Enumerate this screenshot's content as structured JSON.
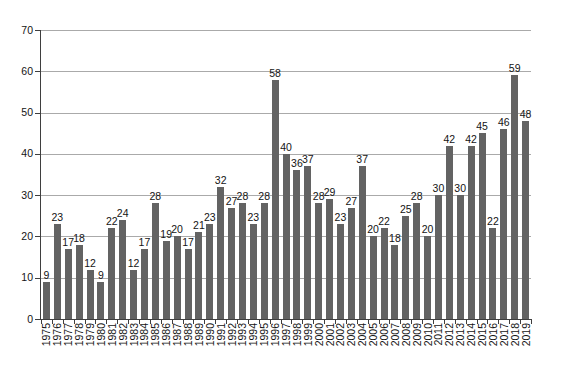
{
  "chart_data": {
    "type": "bar",
    "title": "",
    "xlabel": "",
    "ylabel": "",
    "categories": [
      "1975",
      "1976",
      "1977",
      "1978",
      "1979",
      "1980",
      "1981",
      "1982",
      "1983",
      "1984",
      "1985",
      "1986",
      "1987",
      "1988",
      "1989",
      "1990",
      "1991",
      "1992",
      "1993",
      "1994",
      "1995",
      "1996",
      "1997",
      "1998",
      "1999",
      "2000",
      "2001",
      "2002",
      "2003",
      "2004",
      "2005",
      "2006",
      "2007",
      "2008",
      "2009",
      "2010",
      "2011",
      "2012",
      "2013",
      "2014",
      "2015",
      "2016",
      "2017",
      "2018",
      "2019"
    ],
    "values": [
      9,
      23,
      17,
      18,
      12,
      9,
      22,
      24,
      12,
      17,
      28,
      19,
      20,
      17,
      21,
      23,
      32,
      27,
      28,
      23,
      28,
      58,
      40,
      36,
      37,
      28,
      29,
      23,
      27,
      37,
      20,
      22,
      18,
      25,
      28,
      20,
      30,
      42,
      30,
      42,
      45,
      22,
      46,
      59,
      48
    ],
    "ylim": [
      0,
      70
    ],
    "yticks": [
      0,
      10,
      20,
      30,
      40,
      50,
      60,
      70
    ],
    "grid": true,
    "bar_labels": true,
    "legend": "none",
    "colors": {
      "bar": "#636363",
      "gridline": "#aaaaaa",
      "axis": "#3f3f3f",
      "text": "#141414",
      "background": "#ffffff"
    }
  }
}
